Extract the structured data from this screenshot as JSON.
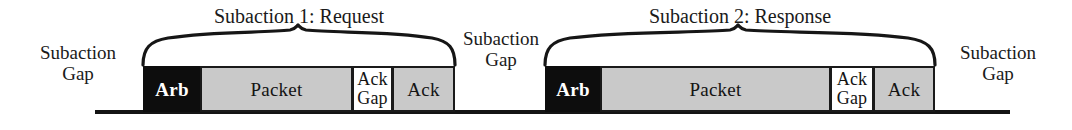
{
  "figure": {
    "baseline_color": "#141414",
    "block_fill_dark": "#0d0d0d",
    "block_fill_gray": "#c9c9c9",
    "block_fill_white": "#ffffff",
    "block_stroke": "#1a1a1a"
  },
  "braces": [
    {
      "title": "Subaction 1: Request"
    },
    {
      "title": "Subaction 2: Response"
    }
  ],
  "gap_labels": [
    {
      "line1": "Subaction",
      "line2": "Gap"
    },
    {
      "line1": "Subaction",
      "line2": "Gap"
    },
    {
      "line1": "Subaction",
      "line2": "Gap"
    }
  ],
  "subactions": [
    {
      "name": "Subaction 1: Request",
      "blocks": [
        {
          "label": "Arb",
          "kind": "arb"
        },
        {
          "label": "Packet",
          "kind": "packet"
        },
        {
          "label_line1": "Ack",
          "label_line2": "Gap",
          "kind": "ackgap"
        },
        {
          "label": "Ack",
          "kind": "ack"
        }
      ]
    },
    {
      "name": "Subaction 2: Response",
      "blocks": [
        {
          "label": "Arb",
          "kind": "arb"
        },
        {
          "label": "Packet",
          "kind": "packet"
        },
        {
          "label_line1": "Ack",
          "label_line2": "Gap",
          "kind": "ackgap"
        },
        {
          "label": "Ack",
          "kind": "ack"
        }
      ]
    }
  ]
}
